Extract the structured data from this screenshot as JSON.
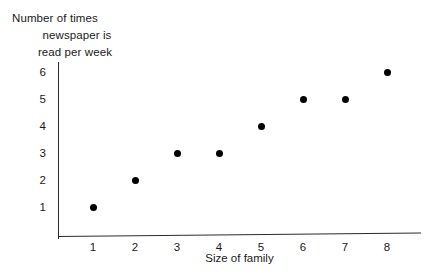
{
  "chart_data": {
    "type": "scatter",
    "title": "",
    "subtitle": "",
    "xlabel": "Size of family",
    "ylabel_lines": [
      "Number of times",
      "newspaper is",
      "read per week"
    ],
    "ylabel": "Number of times newspaper is read per week",
    "x": [
      1,
      2,
      3,
      4,
      5,
      6,
      7,
      8
    ],
    "values": [
      1,
      2,
      3,
      3,
      4,
      5,
      5,
      6
    ],
    "points": [
      {
        "x": 1,
        "y": 1
      },
      {
        "x": 2,
        "y": 2
      },
      {
        "x": 3,
        "y": 3
      },
      {
        "x": 4,
        "y": 3
      },
      {
        "x": 5,
        "y": 4
      },
      {
        "x": 6,
        "y": 5
      },
      {
        "x": 7,
        "y": 5
      },
      {
        "x": 8,
        "y": 6
      }
    ],
    "xticks": [
      "1",
      "2",
      "3",
      "4",
      "5",
      "6",
      "7",
      "8"
    ],
    "yticks": [
      "1",
      "2",
      "3",
      "4",
      "5",
      "6"
    ],
    "xlim": [
      0,
      8.6
    ],
    "ylim": [
      0,
      6.6
    ],
    "grid": false,
    "legend": null,
    "marker_color": "#000000",
    "axis_color": "#2b2b2b",
    "background_color": "#ffffff"
  }
}
